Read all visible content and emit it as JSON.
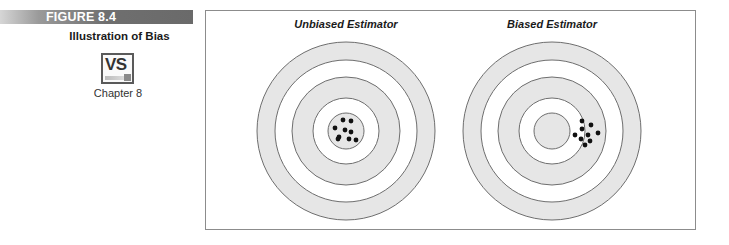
{
  "figure": {
    "label": "FIGURE 8.4",
    "title": "Illustration of Bias",
    "vs_icon_text": "VS",
    "chapter": "Chapter 8"
  },
  "panels": [
    {
      "title": "Unbiased Estimator",
      "center": [
        346,
        131
      ],
      "ring_radii": [
        89,
        71,
        54,
        33,
        18
      ],
      "ring_fills": [
        "#e6e6e6",
        "#ffffff",
        "#e6e6e6",
        "#ffffff",
        "#e6e6e6"
      ],
      "shots": [
        [
          343,
          120
        ],
        [
          351,
          121
        ],
        [
          335,
          128
        ],
        [
          345,
          130
        ],
        [
          351,
          132
        ],
        [
          339,
          137
        ],
        [
          338,
          139
        ],
        [
          349,
          139
        ],
        [
          356,
          140
        ]
      ]
    },
    {
      "title": "Biased Estimator",
      "center": [
        552,
        131
      ],
      "ring_radii": [
        89,
        71,
        54,
        33,
        18
      ],
      "ring_fills": [
        "#e6e6e6",
        "#ffffff",
        "#e6e6e6",
        "#ffffff",
        "#e6e6e6"
      ],
      "shots": [
        [
          582,
          121
        ],
        [
          591,
          125
        ],
        [
          582,
          129
        ],
        [
          598,
          133
        ],
        [
          575,
          135
        ],
        [
          588,
          135
        ],
        [
          581,
          139
        ],
        [
          590,
          141
        ],
        [
          585,
          145
        ]
      ]
    }
  ],
  "colors": {
    "ring_stroke": "#6e6e6e",
    "shot": "#111111",
    "frame_border": "#8c8c8c"
  }
}
